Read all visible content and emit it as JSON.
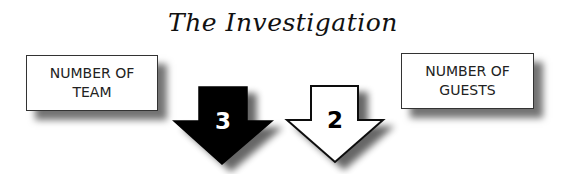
{
  "title": "The Investigation",
  "boxes": {
    "team": {
      "line1": "NUMBER OF",
      "line2": "TEAM"
    },
    "guests": {
      "line1": "NUMBER OF",
      "line2": "GUESTS"
    }
  },
  "arrows": {
    "team": {
      "value": "3",
      "fill": "#000000",
      "text_color": "#ffffff",
      "icon": "down-arrow-filled-icon"
    },
    "guests": {
      "value": "2",
      "fill": "#ffffff",
      "text_color": "#000000",
      "icon": "down-arrow-outline-icon"
    }
  }
}
